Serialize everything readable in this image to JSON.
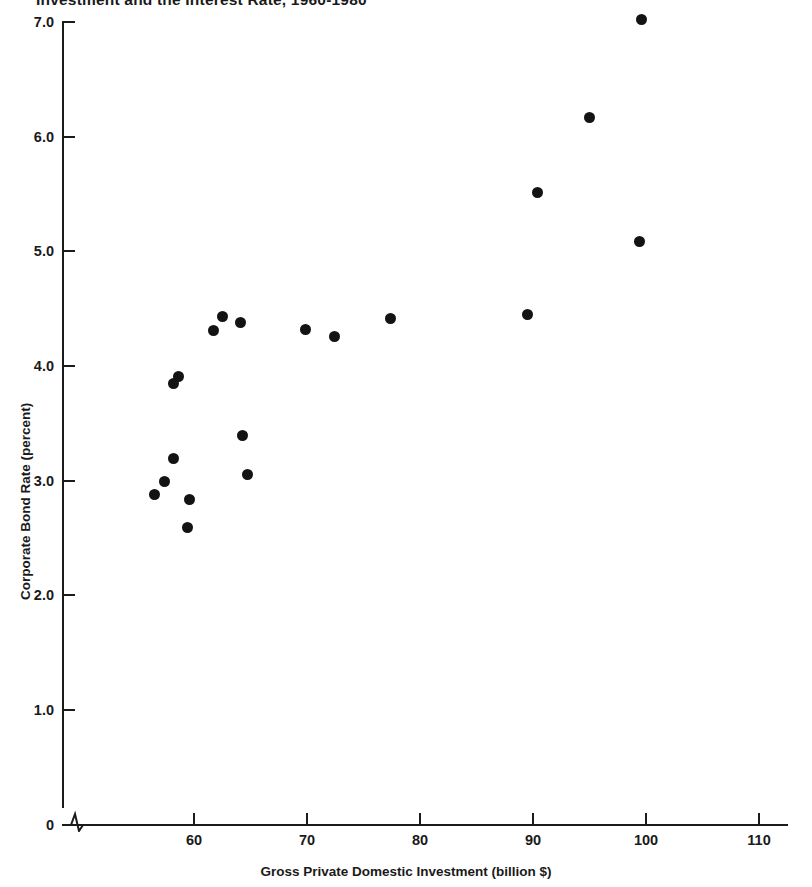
{
  "chart_data": {
    "type": "scatter",
    "title": "Investment and the Interest Rate, 1960-1980",
    "xlabel": "Gross Private Domestic Investment (billion $)",
    "ylabel": "Corporate Bond Rate (percent)",
    "xlim": [
      55.5,
      112
    ],
    "ylim": [
      0,
      7.15
    ],
    "xticks": [
      60,
      70,
      80,
      90,
      100,
      110
    ],
    "xtick_labels": [
      "60",
      "70",
      "80",
      "90",
      "100",
      "110"
    ],
    "yticks": [
      0,
      1.0,
      2.0,
      3.0,
      4.0,
      5.0,
      6.0,
      7.0
    ],
    "ytick_labels": [
      "0",
      "1.0",
      "2.0",
      "3.0",
      "4.0",
      "5.0",
      "6.0",
      "7.0"
    ],
    "grid": false,
    "legend": null,
    "axis_break_x": true,
    "axis_break_y": false,
    "marker": "filled-circle",
    "marker_color": "#131313",
    "points": [
      {
        "x": 56.5,
        "y": 2.88
      },
      {
        "x": 57.4,
        "y": 2.99
      },
      {
        "x": 58.2,
        "y": 3.19
      },
      {
        "x": 58.2,
        "y": 3.85
      },
      {
        "x": 59.4,
        "y": 2.59
      },
      {
        "x": 59.6,
        "y": 2.84
      },
      {
        "x": 58.6,
        "y": 3.91
      },
      {
        "x": 61.7,
        "y": 4.31
      },
      {
        "x": 62.5,
        "y": 4.43
      },
      {
        "x": 64.1,
        "y": 4.38
      },
      {
        "x": 64.3,
        "y": 3.39
      },
      {
        "x": 64.7,
        "y": 3.05
      },
      {
        "x": 69.9,
        "y": 4.32
      },
      {
        "x": 72.4,
        "y": 4.26
      },
      {
        "x": 77.4,
        "y": 4.41
      },
      {
        "x": 89.5,
        "y": 4.45
      },
      {
        "x": 90.4,
        "y": 5.51
      },
      {
        "x": 95.0,
        "y": 6.17
      },
      {
        "x": 99.4,
        "y": 5.09
      },
      {
        "x": 99.6,
        "y": 7.02
      }
    ]
  }
}
